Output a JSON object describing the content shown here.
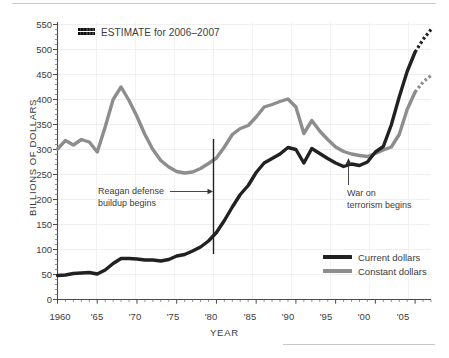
{
  "chart_data": {
    "type": "line",
    "title": "",
    "xlabel": "YEAR",
    "ylabel": "BILLIONS OF DOLLARS",
    "xlim": [
      1960,
      2007
    ],
    "ylim": [
      0,
      550
    ],
    "ytick_values": [
      0,
      50,
      100,
      150,
      200,
      250,
      300,
      350,
      400,
      450,
      500,
      550
    ],
    "ytick_labels": [
      "0",
      "50",
      "100",
      "150",
      "200",
      "250",
      "300",
      "350",
      "400",
      "450",
      "500",
      "550"
    ],
    "xtick_values": [
      1960,
      1965,
      1970,
      1975,
      1980,
      1985,
      1990,
      1995,
      2000,
      2005
    ],
    "xtick_labels": [
      "1960",
      "'65",
      "'70",
      "'75",
      "'80",
      "'85",
      "'90",
      "'95",
      "'00",
      "'05"
    ],
    "minor_x_step": 1,
    "grid": "horizontal-and-vertical-light",
    "legend_position": "bottom-right",
    "series": [
      {
        "name": "Current dollars",
        "color": "#212121",
        "x": [
          1960,
          1961,
          1962,
          1963,
          1964,
          1965,
          1966,
          1967,
          1968,
          1969,
          1970,
          1971,
          1972,
          1973,
          1974,
          1975,
          1976,
          1977,
          1978,
          1979,
          1980,
          1981,
          1982,
          1983,
          1984,
          1985,
          1986,
          1987,
          1988,
          1989,
          1990,
          1991,
          1992,
          1993,
          1994,
          1995,
          1996,
          1997,
          1998,
          1999,
          2000,
          2001,
          2002,
          2003,
          2004,
          2005
        ],
        "values": [
          48,
          49,
          52,
          53,
          54,
          51,
          59,
          72,
          82,
          82,
          81,
          79,
          79,
          77,
          80,
          87,
          90,
          97,
          105,
          117,
          134,
          158,
          185,
          210,
          228,
          254,
          273,
          282,
          291,
          304,
          300,
          273,
          302,
          292,
          282,
          273,
          266,
          271,
          268,
          275,
          295,
          306,
          349,
          405,
          456,
          495
        ],
        "estimate_x": [
          2005,
          2006,
          2007
        ],
        "estimate_values": [
          495,
          520,
          540
        ]
      },
      {
        "name": "Constant dollars",
        "color": "#8d8d8d",
        "x": [
          1960,
          1961,
          1962,
          1963,
          1964,
          1965,
          1966,
          1967,
          1968,
          1969,
          1970,
          1971,
          1972,
          1973,
          1974,
          1975,
          1976,
          1977,
          1978,
          1979,
          1980,
          1981,
          1982,
          1983,
          1984,
          1985,
          1986,
          1987,
          1988,
          1989,
          1990,
          1991,
          1992,
          1993,
          1994,
          1995,
          1996,
          1997,
          1998,
          1999,
          2000,
          2001,
          2002,
          2003,
          2004,
          2005
        ],
        "values": [
          301,
          318,
          309,
          320,
          315,
          295,
          345,
          400,
          425,
          398,
          366,
          330,
          300,
          278,
          265,
          256,
          253,
          255,
          262,
          272,
          283,
          305,
          330,
          342,
          348,
          365,
          385,
          390,
          396,
          401,
          385,
          332,
          358,
          337,
          320,
          305,
          296,
          291,
          288,
          286,
          292,
          299,
          305,
          330,
          380,
          415
        ],
        "estimate_x": [
          2005,
          2006,
          2007
        ],
        "estimate_values": [
          415,
          435,
          448
        ]
      }
    ],
    "annotations": [
      {
        "id": "reagan",
        "text_line1": "Reagan defense",
        "text_line2": "buildup begins",
        "marker": "vertical-line",
        "marker_x": 1980,
        "arrow": "right"
      },
      {
        "id": "war",
        "text_line1": "War on",
        "text_line2": "terrorism begins",
        "marker": "arrow",
        "marker_x": 2001,
        "arrow": "up"
      }
    ],
    "estimate_key": {
      "label": "ESTIMATE for 2006–2007",
      "swatch": "hatched-dotted"
    }
  }
}
